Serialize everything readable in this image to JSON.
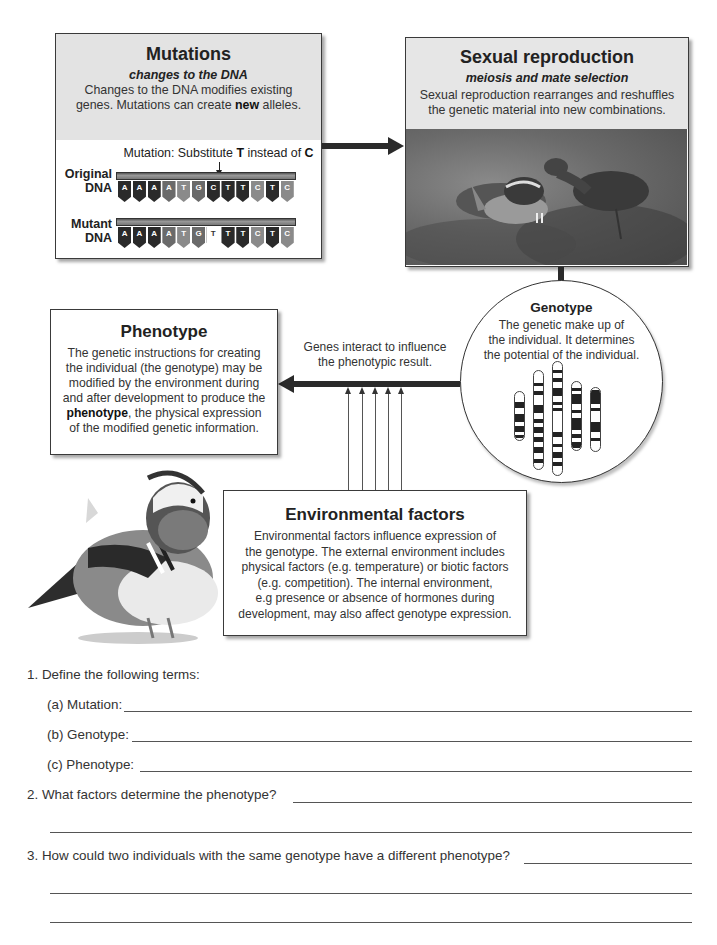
{
  "mutations": {
    "title": "Mutations",
    "subtitle": "changes to the DNA",
    "text_line1": "Changes to the DNA modifies existing",
    "text_line2_pre": "genes. Mutations can create ",
    "text_line2_bold": "new",
    "text_line2_post": " alleles.",
    "caption_pre": "Mutation: Substitute ",
    "caption_bold1": "T",
    "caption_mid": " instead of ",
    "caption_bold2": "C",
    "original_label_1": "Original",
    "original_label_2": "DNA",
    "mutant_label_1": "Mutant",
    "mutant_label_2": "DNA",
    "original_bases": [
      "A",
      "A",
      "A",
      "A",
      "T",
      "G",
      "C",
      "T",
      "T",
      "C",
      "T",
      "C"
    ],
    "mutant_bases": [
      "A",
      "A",
      "A",
      "A",
      "T",
      "G",
      "T",
      "T",
      "T",
      "C",
      "T",
      "C"
    ]
  },
  "sexual_reproduction": {
    "title": "Sexual reproduction",
    "subtitle": "meiosis and mate selection",
    "text_line1": "Sexual reproduction rearranges and reshuffles",
    "text_line2": "the genetic material into new combinations.",
    "photo": "mandarin-ducks-photo"
  },
  "genotype": {
    "title": "Genotype",
    "text_line1": "The genetic make up of",
    "text_line2": "the individual. It determines",
    "text_line3": "the potential of the individual."
  },
  "phenotype": {
    "title": "Phenotype",
    "lines": [
      "The genetic instructions for creating",
      "the individual (the genotype) may be",
      "modified by the environment during",
      "and after development to produce the"
    ],
    "line5_bold": "phenotype",
    "line5_rest": ", the physical expression",
    "line6": "of the modified genetic information."
  },
  "interaction_label": {
    "line1": "Genes interact to influence",
    "line2": "the phenotypic result."
  },
  "environmental": {
    "title": "Environmental factors",
    "lines": [
      "Environmental factors influence expression of",
      "the genotype. The external environment includes",
      "physical factors (e.g. temperature) or biotic factors",
      "(e.g. competition). The internal environment,",
      "e.g presence or absence of hormones during",
      "development, may also affect genotype expression."
    ]
  },
  "questions": {
    "q1": "1.  Define the following terms:",
    "q1a": "(a) Mutation:",
    "q1b": "(b) Genotype:",
    "q1c": "(c) Phenotype:",
    "q2": "2.  What factors determine the phenotype?",
    "q3": "3.  How could two individuals with the same genotype have a different phenotype?"
  },
  "colors": {
    "box_header": "#e3e3e3",
    "arrow": "#2a2a2a",
    "border": "#3a3a3a"
  }
}
